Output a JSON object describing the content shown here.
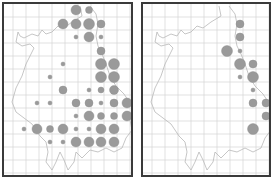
{
  "figure": {
    "type": "distribution-map-pair",
    "dot_color": "#9a9a9a",
    "grid_color": "#d4d4d4",
    "coast_color": "#b8b8b8",
    "frame_color": "#3a3a3a"
  },
  "panels": [
    {
      "id": "left",
      "frame": {
        "x": 2,
        "y": 2,
        "w": 131,
        "h": 175
      },
      "dots": [
        [
          74,
          8,
          5
        ],
        [
          87,
          8,
          3.5
        ],
        [
          61,
          22,
          5
        ],
        [
          74,
          22,
          5
        ],
        [
          87,
          22,
          5.5
        ],
        [
          99,
          22,
          4
        ],
        [
          74,
          35,
          2
        ],
        [
          87,
          35,
          5
        ],
        [
          99,
          35,
          2
        ],
        [
          99,
          49,
          4
        ],
        [
          61,
          62,
          2
        ],
        [
          99,
          62,
          5.5
        ],
        [
          112,
          62,
          5.5
        ],
        [
          48,
          75,
          2
        ],
        [
          99,
          75,
          5.5
        ],
        [
          112,
          75,
          5.5
        ],
        [
          61,
          88,
          4
        ],
        [
          87,
          88,
          2
        ],
        [
          99,
          88,
          3
        ],
        [
          112,
          88,
          4.5
        ],
        [
          35,
          101,
          2
        ],
        [
          48,
          101,
          2
        ],
        [
          74,
          101,
          4
        ],
        [
          87,
          101,
          4
        ],
        [
          99,
          101,
          2
        ],
        [
          112,
          101,
          4
        ],
        [
          125,
          101,
          5
        ],
        [
          74,
          114,
          2
        ],
        [
          87,
          114,
          5
        ],
        [
          99,
          114,
          3.5
        ],
        [
          112,
          114,
          3.5
        ],
        [
          125,
          114,
          5
        ],
        [
          22,
          127,
          2
        ],
        [
          35,
          127,
          5
        ],
        [
          48,
          127,
          3.5
        ],
        [
          61,
          127,
          5
        ],
        [
          74,
          127,
          2
        ],
        [
          87,
          127,
          2
        ],
        [
          99,
          127,
          5
        ],
        [
          112,
          127,
          5
        ],
        [
          48,
          140,
          2
        ],
        [
          61,
          140,
          2
        ],
        [
          74,
          140,
          5
        ],
        [
          87,
          140,
          5
        ],
        [
          99,
          140,
          5
        ],
        [
          112,
          140,
          5
        ]
      ]
    },
    {
      "id": "right",
      "frame": {
        "x": 141,
        "y": 2,
        "w": 130,
        "h": 175
      },
      "dots": [
        [
          238,
          22,
          4
        ],
        [
          238,
          35,
          4
        ],
        [
          225,
          49,
          5.5
        ],
        [
          238,
          49,
          2
        ],
        [
          238,
          62,
          5.5
        ],
        [
          251,
          62,
          4
        ],
        [
          238,
          75,
          2
        ],
        [
          251,
          75,
          5.5
        ],
        [
          251,
          88,
          2
        ],
        [
          251,
          101,
          4
        ],
        [
          264,
          101,
          4
        ],
        [
          264,
          114,
          4
        ],
        [
          251,
          127,
          5.5
        ]
      ]
    }
  ]
}
